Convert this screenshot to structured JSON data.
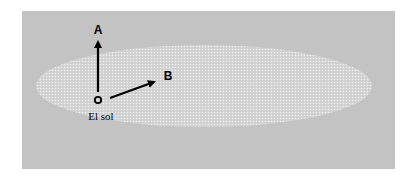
{
  "diagram": {
    "background_color": "#c3c3c3",
    "ellipse_fill": "#dcdcdc",
    "origin_label": "El sol",
    "origin_symbol": "O",
    "vectors": [
      {
        "label": "A",
        "direction": "up"
      },
      {
        "label": "B",
        "direction": "right-up"
      }
    ]
  }
}
